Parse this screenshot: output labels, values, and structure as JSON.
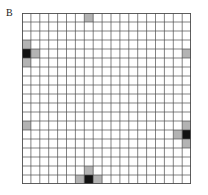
{
  "figure": {
    "panel_label": "B",
    "type": "lattice-grid-diagram",
    "background_color": "#ffffff"
  },
  "grid": {
    "columns": 19,
    "rows": 19,
    "cell_width": 8.9,
    "cell_height": 9.0,
    "origin_x": 0,
    "origin_y": 0,
    "line_color": "#4d4d4d",
    "line_width": 0.7,
    "border_color": "#4d4d4d",
    "border_width": 0.9,
    "empty_cell_color": "#ffffff"
  },
  "colors": {
    "dark_cell": "#111111",
    "light_cell": "#b3b3b3",
    "grid_line": "#4d4d4d",
    "label_text": "#1a1a1a"
  },
  "chart_data": {
    "type": "heatmap",
    "title": "",
    "xlabel": "",
    "ylabel": "",
    "grid": true,
    "legend": "none",
    "nx": 19,
    "ny": 19,
    "value_levels": [
      {
        "name": "empty",
        "value": 0,
        "color": "#ffffff"
      },
      {
        "name": "light",
        "value": 1,
        "color": "#b3b3b3"
      },
      {
        "name": "dark",
        "value": 2,
        "color": "#111111"
      }
    ],
    "marked_cells": [
      {
        "col": 7,
        "row": 0,
        "level": "light"
      },
      {
        "col": 0,
        "row": 3,
        "level": "light"
      },
      {
        "col": 0,
        "row": 4,
        "level": "dark"
      },
      {
        "col": 1,
        "row": 4,
        "level": "light"
      },
      {
        "col": 0,
        "row": 5,
        "level": "light"
      },
      {
        "col": 18,
        "row": 4,
        "level": "light"
      },
      {
        "col": 0,
        "row": 12,
        "level": "light"
      },
      {
        "col": 18,
        "row": 12,
        "level": "light"
      },
      {
        "col": 17,
        "row": 13,
        "level": "light"
      },
      {
        "col": 18,
        "row": 13,
        "level": "dark"
      },
      {
        "col": 18,
        "row": 14,
        "level": "light"
      },
      {
        "col": 7,
        "row": 17,
        "level": "light"
      },
      {
        "col": 6,
        "row": 18,
        "level": "light"
      },
      {
        "col": 7,
        "row": 18,
        "level": "dark"
      },
      {
        "col": 8,
        "row": 18,
        "level": "light"
      }
    ]
  }
}
